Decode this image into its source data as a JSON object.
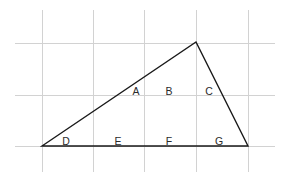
{
  "figure": {
    "background_color": "#ffffff",
    "width": 286,
    "height": 186,
    "grid": {
      "color": "#d2d2d2",
      "vertical_x": [
        42,
        93,
        144,
        196,
        248
      ],
      "vertical_y_start": 10,
      "vertical_y_end": 172,
      "horizontal_y": [
        43,
        95,
        146
      ],
      "horizontal_x_start": 15,
      "horizontal_x_end": 275
    },
    "triangle": {
      "color": "#1a1a1a",
      "vertices": {
        "left": [
          42,
          146
        ],
        "apex": [
          196,
          42
        ],
        "right": [
          248,
          146
        ]
      }
    },
    "labels": [
      {
        "text": "A",
        "x": 136,
        "y": 95
      },
      {
        "text": "B",
        "x": 169,
        "y": 95
      },
      {
        "text": "C",
        "x": 209,
        "y": 95
      },
      {
        "text": "D",
        "x": 66,
        "y": 145
      },
      {
        "text": "E",
        "x": 118,
        "y": 145
      },
      {
        "text": "F",
        "x": 169,
        "y": 145
      },
      {
        "text": "G",
        "x": 219,
        "y": 145
      }
    ]
  }
}
